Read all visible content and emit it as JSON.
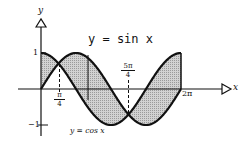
{
  "title": "y = sin x",
  "axes": {
    "x_label": "x",
    "y_label": "y",
    "y_ticks": [
      "1",
      "−1"
    ],
    "x_ticks": [
      {
        "num": "π",
        "den": "4"
      },
      {
        "num": "5π",
        "den": "4"
      },
      {
        "text": "2π"
      }
    ]
  },
  "curve_labels": {
    "cos": "y = cos x"
  },
  "colors": {
    "stroke": "#111111",
    "fill": "#c8c8c8"
  }
}
